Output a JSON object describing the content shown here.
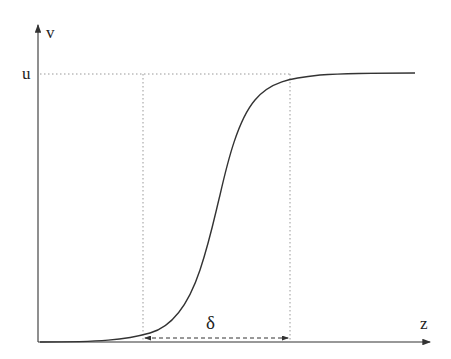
{
  "diagram": {
    "type": "sigmoid-transition-plot",
    "axes": {
      "y_label": "v",
      "x_label": "z"
    },
    "annotations": {
      "level_label": "u",
      "width_label": "δ"
    },
    "colors": {
      "curve": "#333333",
      "axis": "#333333",
      "guide": "#999999"
    }
  }
}
